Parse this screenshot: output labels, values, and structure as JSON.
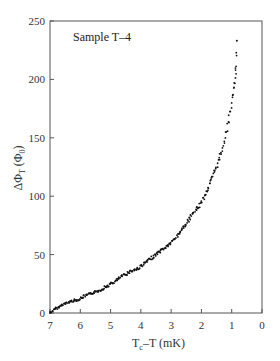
{
  "chart_data": {
    "type": "scatter",
    "title": "",
    "annotation": "Sample T–4",
    "xlabel": "Tc–T (mK)",
    "ylabel": "ΔΦT (Φ0)",
    "xlim": [
      7,
      0
    ],
    "ylim": [
      0,
      250
    ],
    "x_inverted": true,
    "xticks": [
      7,
      6,
      5,
      4,
      3,
      2,
      1,
      0
    ],
    "yticks": [
      0,
      50,
      100,
      150,
      200,
      250
    ],
    "grid": false,
    "legend": null,
    "series": [
      {
        "name": "Sample T-4",
        "marker": "dot",
        "color": "#111111",
        "x": [
          7.0,
          6.9,
          6.8,
          6.7,
          6.6,
          6.5,
          6.4,
          6.3,
          6.2,
          6.1,
          6.0,
          5.9,
          5.8,
          5.7,
          5.6,
          5.5,
          5.4,
          5.3,
          5.2,
          5.1,
          5.0,
          4.9,
          4.8,
          4.7,
          4.6,
          4.5,
          4.4,
          4.3,
          4.2,
          4.1,
          4.0,
          3.9,
          3.8,
          3.7,
          3.6,
          3.5,
          3.4,
          3.3,
          3.2,
          3.1,
          3.0,
          2.9,
          2.8,
          2.7,
          2.6,
          2.5,
          2.4,
          2.3,
          2.2,
          2.1,
          2.0,
          1.9,
          1.8,
          1.7,
          1.6,
          1.5,
          1.4,
          1.3,
          1.2,
          1.1,
          1.0,
          0.95,
          0.9,
          0.87,
          0.85,
          0.83
        ],
        "y": [
          0,
          2,
          4,
          5,
          7,
          8,
          9,
          10,
          11,
          11,
          12,
          14,
          15,
          16,
          17,
          18,
          19,
          20,
          22,
          23,
          25,
          26,
          28,
          30,
          32,
          33,
          35,
          36,
          37,
          38,
          40,
          42,
          44,
          46,
          48,
          50,
          52,
          54,
          56,
          58,
          60,
          63,
          66,
          70,
          73,
          76,
          80,
          84,
          88,
          91,
          95,
          100,
          106,
          112,
          118,
          125,
          133,
          142,
          153,
          165,
          180,
          188,
          196,
          204,
          210,
          233
        ]
      }
    ]
  }
}
